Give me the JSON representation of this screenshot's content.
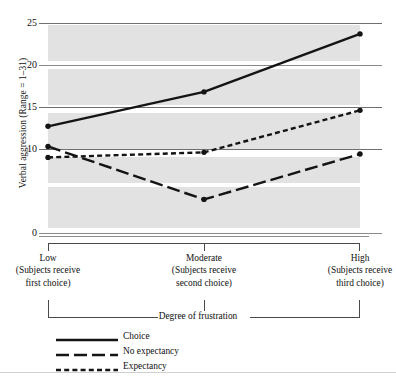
{
  "axis": {
    "y_title": "Verbal aggression (Range = 1–31)",
    "y_ticks": [
      "25",
      "20",
      "15",
      "10",
      "0"
    ],
    "x_caption": "Degree of frustration"
  },
  "x_groups": [
    {
      "name": "Low",
      "line2": "(Subjects receive",
      "line3": "first choice)"
    },
    {
      "name": "Moderate",
      "line2": "(Subjects receive",
      "line3": "second choice)"
    },
    {
      "name": "High",
      "line2": "(Subjects receive",
      "line3": "third choice)"
    }
  ],
  "legend": [
    {
      "label": "Choice",
      "style": "solid"
    },
    {
      "label": "No expectancy",
      "style": "long-dash"
    },
    {
      "label": "Expectancy",
      "style": "short-dash"
    }
  ],
  "chart_data": {
    "type": "line",
    "title": "",
    "xlabel": "Degree of frustration",
    "ylabel": "Verbal aggression (Range = 1–31)",
    "categories": [
      "Low",
      "Moderate",
      "High"
    ],
    "category_sublabels": [
      "(Subjects receive first choice)",
      "(Subjects receive second choice)",
      "(Subjects receive third choice)"
    ],
    "ylim": [
      0,
      25
    ],
    "ytick_values": [
      0,
      10,
      15,
      20,
      25
    ],
    "grid": true,
    "legend_position": "below-plot-left",
    "series": [
      {
        "name": "Choice",
        "style": "solid",
        "values": [
          12.7,
          16.8,
          23.7
        ]
      },
      {
        "name": "No expectancy",
        "style": "long-dash",
        "values": [
          10.3,
          4.0,
          9.4
        ]
      },
      {
        "name": "Expectancy",
        "style": "short-dash",
        "values": [
          9.0,
          9.6,
          14.6
        ]
      }
    ]
  }
}
